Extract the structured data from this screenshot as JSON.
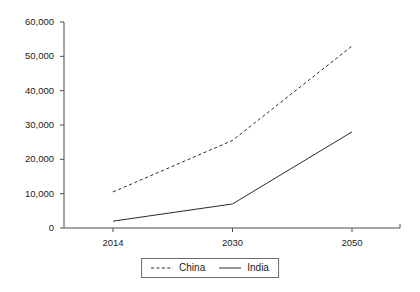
{
  "chart_data": {
    "type": "line",
    "title": "",
    "subtitle": "",
    "xlabel": "",
    "ylabel": "",
    "categories": [
      "2014",
      "2030",
      "2050"
    ],
    "series": [
      {
        "name": "China",
        "values": [
          10500,
          25500,
          53000
        ],
        "style": "dashed",
        "color": "#2b2b2b"
      },
      {
        "name": "India",
        "values": [
          2000,
          7000,
          28000
        ],
        "style": "solid",
        "color": "#2b2b2b"
      }
    ],
    "ylim": [
      0,
      60000
    ],
    "ytick_values": [
      0,
      10000,
      20000,
      30000,
      40000,
      50000,
      60000
    ],
    "ytick_labels": [
      "0",
      "10,000",
      "20,000",
      "30,000",
      "40,000",
      "50,000",
      "60,000"
    ],
    "xtick_labels": [
      "2014",
      "2030",
      "2050"
    ],
    "grid": false,
    "legend_position": "bottom-center",
    "legend_entries": [
      {
        "label": "China",
        "style": "dashed"
      },
      {
        "label": "India",
        "style": "solid"
      }
    ],
    "axis_color": "#4d4d4d",
    "background": "#ffffff"
  },
  "legend": {
    "china_label": "China",
    "india_label": "India"
  }
}
